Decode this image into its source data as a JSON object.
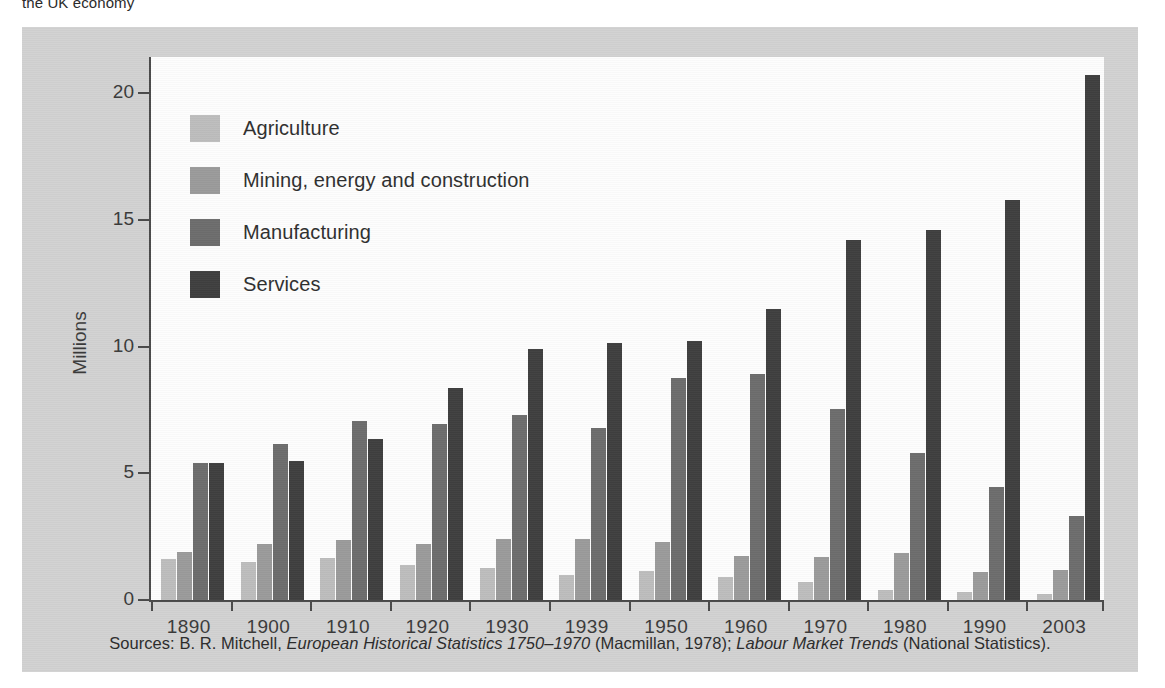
{
  "top_caption": "the UK economy",
  "chart_data": {
    "type": "bar",
    "title": "",
    "subtitle": "",
    "xlabel": "",
    "ylabel": "Millions",
    "ylim": [
      0,
      21.5
    ],
    "yticks": [
      0,
      5,
      10,
      15,
      20
    ],
    "ytick_labels": [
      "0",
      "5",
      "10",
      "15",
      "20"
    ],
    "grid": false,
    "legend_position": "inside-top-left",
    "categories": [
      "1890",
      "1900",
      "1910",
      "1920",
      "1930",
      "1939",
      "1950",
      "1960",
      "1970",
      "1980",
      "1990",
      "2003"
    ],
    "series": [
      {
        "name": "Agriculture",
        "color": "#bdbdbd",
        "values": [
          1.6,
          1.5,
          1.65,
          1.4,
          1.25,
          1.0,
          1.15,
          0.9,
          0.7,
          0.4,
          0.3,
          0.25
        ]
      },
      {
        "name": "Mining, energy and construction",
        "color": "#9b9b9b",
        "values": [
          1.9,
          2.2,
          2.35,
          2.2,
          2.4,
          2.4,
          2.3,
          1.75,
          1.7,
          1.85,
          1.1,
          1.2
        ]
      },
      {
        "name": "Manufacturing",
        "color": "#6d6d6d",
        "values": [
          5.4,
          6.15,
          7.05,
          6.95,
          7.3,
          6.8,
          8.75,
          8.9,
          7.55,
          5.8,
          4.45,
          3.3
        ]
      },
      {
        "name": "Services",
        "color": "#3f3f3f",
        "values": [
          5.4,
          5.5,
          6.35,
          8.35,
          9.9,
          10.15,
          10.2,
          11.5,
          14.2,
          14.6,
          15.8,
          20.7
        ]
      }
    ]
  },
  "legend": {
    "items": [
      {
        "label": "Agriculture",
        "color": "#bdbdbd"
      },
      {
        "label": "Mining, energy and construction",
        "color": "#9b9b9b"
      },
      {
        "label": "Manufacturing",
        "color": "#6d6d6d"
      },
      {
        "label": "Services",
        "color": "#3f3f3f"
      }
    ]
  },
  "source_note": {
    "prefix": "Sources: B. R. Mitchell, ",
    "italic_1": "European Historical Statistics 1750–1970",
    "middle": " (Macmillan, 1978); ",
    "italic_2": "Labour Market Trends",
    "suffix": " (National Statistics)."
  }
}
